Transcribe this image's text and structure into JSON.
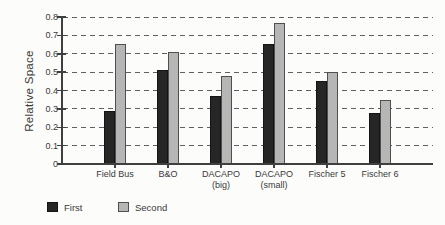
{
  "chart_data": {
    "type": "bar",
    "title": "",
    "xlabel": "",
    "ylabel": "Relative Space",
    "ylim": [
      0,
      0.8
    ],
    "ytick_step": 0.1,
    "ytick_labels": [
      "0",
      "0.1",
      "0.2",
      "0.3",
      "0.4",
      "0.5",
      "0.6",
      "0.7",
      "0.8"
    ],
    "grid": "horizontal-dashed",
    "legend_position": "bottom-left",
    "categories": [
      "Field Bus",
      "B&O",
      "DACAPO (big)",
      "DACAPO (small)",
      "Fischer 5",
      "Fischer 6"
    ],
    "category_label_lines": [
      [
        "Field Bus"
      ],
      [
        "B&O"
      ],
      [
        "DACAPO",
        "(big)"
      ],
      [
        "DACAPO",
        "(small)"
      ],
      [
        "Fischer 5"
      ],
      [
        "Fischer 6"
      ]
    ],
    "series": [
      {
        "name": "First",
        "color": "#262626",
        "border": "#141414",
        "values": [
          0.29,
          0.51,
          0.37,
          0.655,
          0.45,
          0.275
        ]
      },
      {
        "name": "Second",
        "color": "#b6b6b6",
        "border": "#4f4f4f",
        "values": [
          0.655,
          0.61,
          0.48,
          0.765,
          0.5,
          0.35
        ]
      }
    ]
  },
  "colors": {
    "background": "#fcfcfa",
    "axis": "#3f3f3f",
    "grid": "#5f5f5f",
    "text": "#3a3a3a",
    "series_first": "#262626",
    "series_second": "#b6b6b6"
  }
}
